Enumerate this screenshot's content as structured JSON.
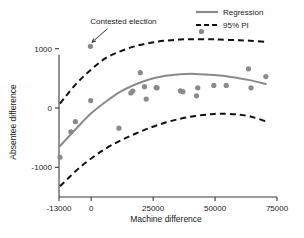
{
  "chart_data": {
    "type": "scatter",
    "title": "",
    "xlabel": "Machine difference",
    "ylabel": "Absentee difference",
    "xlim": [
      -13000,
      75000
    ],
    "ylim": [
      -1500,
      1450
    ],
    "xticks": [
      -13000,
      0,
      25000,
      50000,
      75000
    ],
    "xtick_labels": [
      "-13000",
      "0",
      "25000",
      "50000",
      "75000"
    ],
    "yticks": [
      -1000,
      0,
      1000
    ],
    "ytick_labels": [
      "-1000",
      "0",
      "1000"
    ],
    "grid": false,
    "legend_position": "top-right",
    "point_color": "#8a8a8a",
    "regression_color": "#8a8a8a",
    "pi_color": "#111111",
    "points": [
      {
        "x": -12600,
        "y": -830
      },
      {
        "x": -8200,
        "y": -400
      },
      {
        "x": -6400,
        "y": -230
      },
      {
        "x": -300,
        "y": 1040
      },
      {
        "x": -200,
        "y": 125
      },
      {
        "x": 11200,
        "y": -340
      },
      {
        "x": 16000,
        "y": 255
      },
      {
        "x": 16800,
        "y": 285
      },
      {
        "x": 19800,
        "y": 595
      },
      {
        "x": 21500,
        "y": 360
      },
      {
        "x": 22200,
        "y": 150
      },
      {
        "x": 26200,
        "y": 345
      },
      {
        "x": 26600,
        "y": 340
      },
      {
        "x": 36000,
        "y": 290
      },
      {
        "x": 37000,
        "y": 275
      },
      {
        "x": 42500,
        "y": 205
      },
      {
        "x": 43000,
        "y": 340
      },
      {
        "x": 44500,
        "y": 1290
      },
      {
        "x": 49500,
        "y": 380
      },
      {
        "x": 54500,
        "y": 380
      },
      {
        "x": 63500,
        "y": 660
      },
      {
        "x": 64500,
        "y": 340
      },
      {
        "x": 70500,
        "y": 530
      }
    ],
    "regression": {
      "name": "Regression",
      "x": [
        -12600,
        -6000,
        0,
        6000,
        12000,
        18000,
        24000,
        30000,
        36000,
        42000,
        48000,
        52000,
        58000,
        64000,
        70500
      ],
      "y": [
        -640,
        -345,
        -90,
        110,
        280,
        400,
        490,
        545,
        570,
        575,
        560,
        550,
        515,
        470,
        405
      ]
    },
    "pi_upper": {
      "name": "95% PI upper",
      "x": [
        -12600,
        -6000,
        0,
        6000,
        12000,
        18000,
        24000,
        30000,
        36000,
        42000,
        48000,
        52000,
        58000,
        64000,
        70500
      ],
      "y": [
        75,
        410,
        650,
        845,
        960,
        1045,
        1100,
        1135,
        1155,
        1160,
        1160,
        1155,
        1145,
        1135,
        1115
      ]
    },
    "pi_lower": {
      "name": "95% PI lower",
      "x": [
        -12600,
        -6000,
        0,
        6000,
        12000,
        18000,
        24000,
        30000,
        36000,
        42000,
        48000,
        52000,
        58000,
        64000,
        70500
      ],
      "y": [
        -1320,
        -1055,
        -850,
        -680,
        -545,
        -430,
        -330,
        -245,
        -180,
        -135,
        -105,
        -95,
        -105,
        -140,
        -225
      ]
    },
    "legend": [
      {
        "label": "Regression",
        "style": "solid",
        "color": "#8a8a8a"
      },
      {
        "label": "95% PI",
        "style": "dashed",
        "color": "#111111"
      }
    ],
    "annotations": [
      {
        "text": "Contested election",
        "target_x": -300,
        "target_y": 1040,
        "text_x": 13000,
        "text_y": 1420
      }
    ]
  }
}
